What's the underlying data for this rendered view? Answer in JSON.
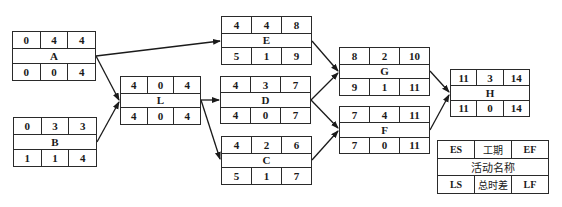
{
  "diagram": {
    "type": "activity-on-node network (CPM)",
    "nodes": [
      {
        "id": "A",
        "name": "A",
        "ES": "0",
        "D": "4",
        "EF": "4",
        "LS": "0",
        "TF": "0",
        "LF": "4"
      },
      {
        "id": "B",
        "name": "B",
        "ES": "0",
        "D": "3",
        "EF": "3",
        "LS": "1",
        "TF": "1",
        "LF": "4"
      },
      {
        "id": "L",
        "name": "L",
        "ES": "4",
        "D": "0",
        "EF": "4",
        "LS": "4",
        "TF": "0",
        "LF": "4"
      },
      {
        "id": "E",
        "name": "E",
        "ES": "4",
        "D": "4",
        "EF": "8",
        "LS": "5",
        "TF": "1",
        "LF": "9"
      },
      {
        "id": "D",
        "name": "D",
        "ES": "4",
        "D": "3",
        "EF": "7",
        "LS": "4",
        "TF": "0",
        "LF": "7"
      },
      {
        "id": "C",
        "name": "C",
        "ES": "4",
        "D": "2",
        "EF": "6",
        "LS": "5",
        "TF": "1",
        "LF": "7"
      },
      {
        "id": "G",
        "name": "G",
        "ES": "8",
        "D": "2",
        "EF": "10",
        "LS": "9",
        "TF": "1",
        "LF": "11"
      },
      {
        "id": "F",
        "name": "F",
        "ES": "7",
        "D": "4",
        "EF": "11",
        "LS": "7",
        "TF": "0",
        "LF": "11"
      },
      {
        "id": "H",
        "name": "H",
        "ES": "11",
        "D": "3",
        "EF": "14",
        "LS": "11",
        "TF": "0",
        "LF": "14"
      }
    ],
    "edges": [
      {
        "from": "A",
        "to": "E"
      },
      {
        "from": "A",
        "to": "L"
      },
      {
        "from": "B",
        "to": "L"
      },
      {
        "from": "L",
        "to": "D"
      },
      {
        "from": "L",
        "to": "C"
      },
      {
        "from": "E",
        "to": "G"
      },
      {
        "from": "D",
        "to": "G"
      },
      {
        "from": "D",
        "to": "F"
      },
      {
        "from": "C",
        "to": "F"
      },
      {
        "from": "G",
        "to": "H"
      },
      {
        "from": "F",
        "to": "H"
      }
    ],
    "legend": {
      "es": "ES",
      "duration": "工期",
      "ef": "EF",
      "activity_name": "活动名称",
      "ls": "LS",
      "total_float": "总时差",
      "lf": "LF"
    },
    "colors": {
      "line": "#1a1a1a",
      "border": "#2a2a2a",
      "background": "#ffffff"
    }
  }
}
